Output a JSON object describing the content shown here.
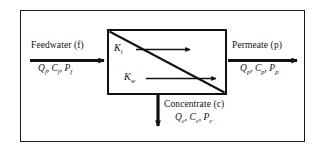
{
  "diagram": {
    "frame_color": "#1a1a1a",
    "box_color": "#111111",
    "arrow_color": "#111111",
    "background": "#ffffff"
  },
  "streams": {
    "feed": {
      "name": "Feedwater (f)",
      "vars": "Q, C, P",
      "var_q": "Q",
      "var_c": "C",
      "var_p": "P",
      "subscript": "f",
      "direction": "right"
    },
    "permeate": {
      "name": "Permeate (p)",
      "vars": "Q, C, P",
      "var_q": "Q",
      "var_c": "C",
      "var_p": "P",
      "subscript": "p",
      "direction": "right"
    },
    "concentrate": {
      "name": "Concentrate (c)",
      "vars": "Q, C, P",
      "var_q": "Q",
      "var_c": "C",
      "var_p": "P",
      "subscript": "c",
      "direction": "down"
    }
  },
  "coefficients": {
    "solute": {
      "symbol": "K",
      "subscript": "i"
    },
    "water": {
      "symbol": "K",
      "subscript": "w"
    }
  },
  "separators": {
    "comma": ", "
  }
}
